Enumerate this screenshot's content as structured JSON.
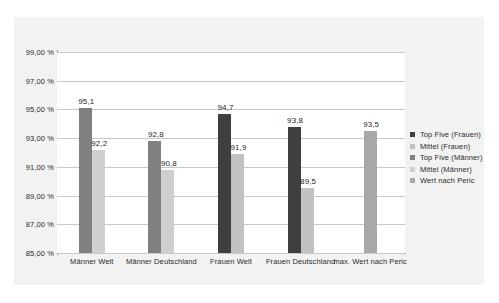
{
  "chart_data": {
    "type": "bar",
    "title": "",
    "xlabel": "",
    "ylabel": "",
    "ylim": [
      85,
      99
    ],
    "grid": true,
    "legend_position": "right",
    "categories": [
      "Männer Welt",
      "Männer Deutschland",
      "Frauen Welt",
      "Frauen Deutschland",
      "max. Wert nach Peric"
    ],
    "y_tick_labels": [
      "99,00 %",
      "97,00 %",
      "95,00 %",
      "93,00 %",
      "91,00 %",
      "89,00 %",
      "87,00 %",
      "85,00 %"
    ],
    "y_tick_values": [
      99,
      97,
      95,
      93,
      91,
      89,
      87,
      85
    ],
    "series": [
      {
        "name": "Top Five (Frauen)",
        "color": "#3f3f3f",
        "values": [
          null,
          null,
          94.7,
          93.8,
          null
        ],
        "labels": [
          "",
          "",
          "94,7",
          "93,8",
          ""
        ]
      },
      {
        "name": "Mittel (Frauen)",
        "color": "#c2c2c2",
        "values": [
          null,
          null,
          91.9,
          89.5,
          null
        ],
        "labels": [
          "",
          "",
          "91,9",
          "89,5",
          ""
        ]
      },
      {
        "name": "Top Five (Männer)",
        "color": "#808080",
        "values": [
          95.1,
          92.8,
          null,
          null,
          null
        ],
        "labels": [
          "95,1",
          "92,8",
          "",
          "",
          ""
        ]
      },
      {
        "name": "Mittel (Männer)",
        "color": "#cfcfcf",
        "values": [
          92.2,
          90.8,
          null,
          null,
          null
        ],
        "labels": [
          "92,2",
          "90,8",
          "",
          "",
          ""
        ]
      },
      {
        "name": "Wert nach Peric",
        "color": "#a8a8a8",
        "values": [
          null,
          null,
          null,
          null,
          93.5
        ],
        "labels": [
          "",
          "",
          "",
          "",
          "93,5"
        ]
      }
    ],
    "bars": [
      {
        "category": "Männer Welt",
        "series": "Top Five (Männer)",
        "value": 95.1,
        "label": "95,1",
        "color": "#808080"
      },
      {
        "category": "Männer Welt",
        "series": "Mittel (Männer)",
        "value": 92.2,
        "label": "92,2",
        "color": "#cfcfcf"
      },
      {
        "category": "Männer Deutschland",
        "series": "Top Five (Männer)",
        "value": 92.8,
        "label": "92,8",
        "color": "#808080"
      },
      {
        "category": "Männer Deutschland",
        "series": "Mittel (Männer)",
        "value": 90.8,
        "label": "90,8",
        "color": "#cfcfcf"
      },
      {
        "category": "Frauen Welt",
        "series": "Top Five (Frauen)",
        "value": 94.7,
        "label": "94,7",
        "color": "#3f3f3f"
      },
      {
        "category": "Frauen Welt",
        "series": "Mittel (Frauen)",
        "value": 91.9,
        "label": "91,9",
        "color": "#c2c2c2"
      },
      {
        "category": "Frauen Deutschland",
        "series": "Top Five (Frauen)",
        "value": 93.8,
        "label": "93,8",
        "color": "#3f3f3f"
      },
      {
        "category": "Frauen Deutschland",
        "series": "Mittel (Frauen)",
        "value": 89.5,
        "label": "89,5",
        "color": "#c2c2c2"
      },
      {
        "category": "max. Wert nach Peric",
        "series": "Wert nach Peric",
        "value": 93.5,
        "label": "93,5",
        "color": "#a8a8a8"
      }
    ]
  },
  "colors": {
    "frame_background": "#f2f2f2",
    "plot_background": "#ffffff",
    "gridline": "#c9c9c9",
    "axis": "#8a8a8a",
    "text": "#2b2b2b"
  }
}
